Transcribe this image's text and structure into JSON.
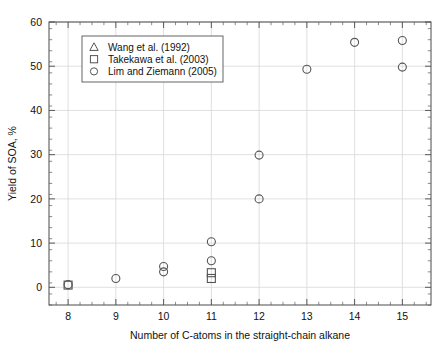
{
  "chart_data": {
    "type": "scatter",
    "title": "",
    "xlabel": "Number of C-atoms in the straight-chain alkane",
    "ylabel": "Yield of SOA, %",
    "xlim": [
      7.6,
      15.6
    ],
    "ylim": [
      -4,
      60
    ],
    "xticks": [
      8,
      9,
      10,
      11,
      12,
      13,
      14,
      15
    ],
    "yticks": [
      0,
      10,
      20,
      30,
      40,
      50,
      60
    ],
    "xtick_labels": [
      "8",
      "9",
      "10",
      "11",
      "12",
      "13",
      "14",
      "15"
    ],
    "ytick_labels": [
      "0",
      "10",
      "20",
      "30",
      "40",
      "50",
      "60"
    ],
    "grid": true,
    "minor_ticks": true,
    "legend_position": "upper-left",
    "series": [
      {
        "name": "Wang et al. (1992)",
        "marker": "triangle",
        "points": []
      },
      {
        "name": "Takekawa et al. (2003)",
        "marker": "square",
        "points": [
          {
            "x": 8,
            "y": 0.5
          },
          {
            "x": 11,
            "y": 3.3
          },
          {
            "x": 11,
            "y": 2.0
          }
        ]
      },
      {
        "name": "Lim and Ziemann (2005)",
        "marker": "circle",
        "points": [
          {
            "x": 8,
            "y": 0.6
          },
          {
            "x": 9,
            "y": 2.0
          },
          {
            "x": 10,
            "y": 4.7
          },
          {
            "x": 10,
            "y": 3.5
          },
          {
            "x": 11,
            "y": 10.3
          },
          {
            "x": 11,
            "y": 6.0
          },
          {
            "x": 12,
            "y": 29.9
          },
          {
            "x": 12,
            "y": 20.0
          },
          {
            "x": 13,
            "y": 49.3
          },
          {
            "x": 14,
            "y": 55.4
          },
          {
            "x": 15,
            "y": 55.8
          },
          {
            "x": 15,
            "y": 49.8
          }
        ]
      }
    ]
  },
  "legend": {
    "entries": [
      {
        "marker": "triangle-marker",
        "label": "Wang et al. (1992)"
      },
      {
        "marker": "square-marker",
        "label": "Takekawa et al. (2003)"
      },
      {
        "marker": "circle-marker",
        "label": "Lim and Ziemann (2005)"
      }
    ]
  },
  "colors": {
    "marker": "#555555",
    "frame": "#4a4a4a",
    "grid": "#d8d8d8",
    "background": "#ffffff"
  }
}
